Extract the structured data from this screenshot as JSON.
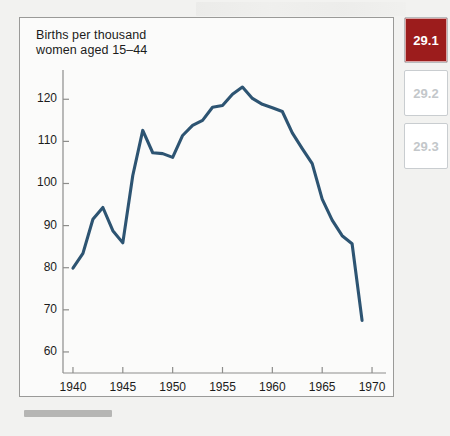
{
  "figure": {
    "caption_line1": "Births per thousand",
    "caption_line2": "women aged 15–44",
    "caption": "Births per thousand\nwomen aged 15–44"
  },
  "rail": {
    "tiles": [
      {
        "label": "29.1",
        "state": "active"
      },
      {
        "label": "29.2",
        "state": "idle"
      },
      {
        "label": "29.3",
        "state": "idle"
      }
    ]
  },
  "colors": {
    "line": "#2d5472",
    "active_tile": "#9c1c1c",
    "idle_tile_text": "#c3c7ca",
    "frame_border": "#9a9a98",
    "plot_background": "#fbfbfa"
  },
  "chart_data": {
    "type": "line",
    "title": "Births per thousand women aged 15–44",
    "xlabel": "",
    "ylabel": "Births per thousand women aged 15–44",
    "xlim": [
      1939,
      1971
    ],
    "ylim": [
      55,
      126
    ],
    "grid": false,
    "legend": "none",
    "xticks": [
      1940,
      1945,
      1950,
      1955,
      1960,
      1965,
      1970
    ],
    "yticks": [
      60,
      70,
      80,
      90,
      100,
      110,
      120
    ],
    "series": [
      {
        "name": "Births per thousand women aged 15–44",
        "color": "#2d5472",
        "x": [
          1940,
          1941,
          1942,
          1943,
          1944,
          1945,
          1946,
          1947,
          1948,
          1949,
          1950,
          1951,
          1952,
          1953,
          1954,
          1955,
          1956,
          1957,
          1958,
          1959,
          1960,
          1961,
          1962,
          1963,
          1964,
          1965,
          1966,
          1967,
          1968,
          1969
        ],
        "y": [
          79.9,
          83.4,
          91.5,
          94.3,
          88.8,
          85.9,
          101.9,
          112.6,
          107.3,
          107.1,
          106.2,
          111.4,
          113.8,
          115.0,
          118.1,
          118.5,
          121.2,
          122.9,
          120.2,
          118.8,
          118.0,
          117.1,
          112.0,
          108.3,
          104.7,
          96.3,
          91.3,
          87.6,
          85.7,
          67.5
        ]
      }
    ],
    "annotations": []
  }
}
